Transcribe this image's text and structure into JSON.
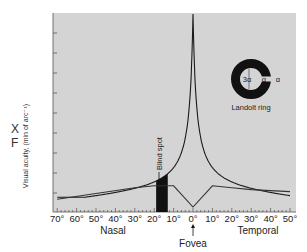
{
  "side_letters": {
    "top": "X",
    "bottom": "F"
  },
  "chart_data": {
    "type": "line",
    "title": "",
    "xlabel_left": "Nasal",
    "xlabel_right": "Temporal",
    "ylabel": "Visual acuity, (min of arc⁻¹)",
    "x_ticks": [
      "70°",
      "60°",
      "50°",
      "40°",
      "30°",
      "20°",
      "10°",
      "0°",
      "10°",
      "20°",
      "30°",
      "40°",
      "50°"
    ],
    "x_tick_values": [
      -70,
      -60,
      -50,
      -40,
      -30,
      -20,
      -10,
      0,
      10,
      20,
      30,
      40,
      50
    ],
    "xlim": [
      -72,
      52
    ],
    "grid": false,
    "background": "#d4d4d4",
    "series": [
      {
        "name": "Visual acuity (cones)",
        "x": [
          -70,
          -60,
          -50,
          -40,
          -30,
          -25,
          -20,
          -15,
          -10,
          -6,
          -3,
          -1,
          0,
          1,
          3,
          6,
          10,
          15,
          20,
          30,
          40,
          50
        ],
        "values": [
          0.07,
          0.08,
          0.09,
          0.1,
          0.12,
          0.14,
          0.17,
          0.22,
          0.32,
          0.45,
          0.65,
          0.9,
          1.0,
          0.9,
          0.65,
          0.45,
          0.32,
          0.22,
          0.15,
          0.1,
          0.08,
          0.07
        ]
      },
      {
        "name": "Rod density profile",
        "x": [
          -70,
          -50,
          -30,
          -20,
          -10,
          0,
          10,
          20,
          30,
          40,
          50
        ],
        "values": [
          0.04,
          0.07,
          0.1,
          0.11,
          0.11,
          0.0,
          0.11,
          0.1,
          0.09,
          0.085,
          0.08
        ]
      }
    ],
    "annotations": [
      {
        "label": "Blind spot",
        "x_range": [
          -19,
          -13
        ],
        "type": "filled-bar"
      },
      {
        "label": "Fovea",
        "x": 0,
        "type": "arrow"
      },
      {
        "label": "Landolt ring",
        "type": "inset",
        "dims": [
          "3α",
          "α",
          "α"
        ]
      }
    ]
  }
}
